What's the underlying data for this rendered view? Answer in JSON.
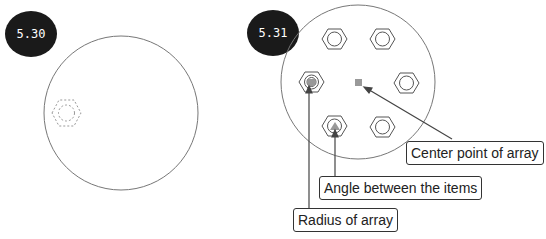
{
  "figures": [
    {
      "id": "fig-a",
      "label": "5.30"
    },
    {
      "id": "fig-b",
      "label": "5.31"
    }
  ],
  "callouts": {
    "center_point": "Center point of array",
    "angle_between": "Angle between the items",
    "radius": "Radius of array"
  },
  "colors": {
    "badge_bg": "#1a1a1a",
    "line": "#555555",
    "marker": "#999999"
  }
}
